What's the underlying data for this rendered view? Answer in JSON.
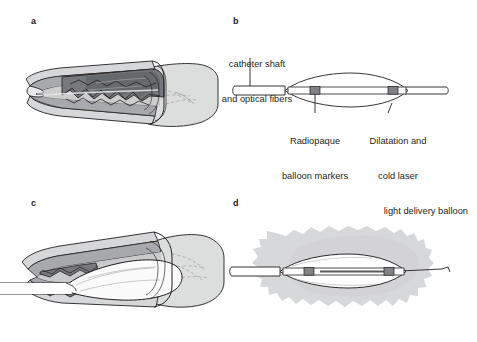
{
  "figure": {
    "background_color": "#ffffff",
    "ink_color": "#231f20"
  },
  "panels": [
    {
      "id": "a",
      "letter": "a",
      "name": "diseased-artery-cutaway",
      "description": "Cutaway longitudinal view of an artery with atherosclerotic plaque narrowing the lumen"
    },
    {
      "id": "b",
      "letter": "b",
      "name": "laser-balloon-catheter-labeled",
      "description": "Side view of the deflated laser balloon catheter with labels"
    },
    {
      "id": "c",
      "letter": "c",
      "name": "balloon-inflated-in-artery",
      "description": "Balloon inflated inside the diseased artery compressing the plaque"
    },
    {
      "id": "d",
      "letter": "d",
      "name": "laser-light-delivery",
      "description": "Inflated balloon emitting diffuse cold laser light into surrounding tissue"
    }
  ],
  "labels": {
    "catheter_shaft": {
      "lines": [
        "catheter shaft",
        "and optical fibers"
      ],
      "line1": "catheter shaft",
      "line2": "and optical fibers"
    },
    "radiopaque_markers": {
      "lines": [
        "Radiopaque",
        "balloon markers"
      ],
      "line1": "Radiopaque",
      "line2": "balloon markers"
    },
    "dilatation_balloon": {
      "lines": [
        "Dilatation and",
        "cold laser",
        "light delivery balloon"
      ],
      "line1": "Dilatation and",
      "line2": "cold laser",
      "line3": "light delivery balloon"
    }
  },
  "colors": {
    "outline": "#231f20",
    "adventitia_light": "#d9dadb",
    "media_mid": "#a7a9ac",
    "plaque_dark": "#808285",
    "plaque_darker": "#6d6e71",
    "lumen_light": "#e6e7e8",
    "balloon_white": "#ffffff",
    "marker_gray": "#808285",
    "laser_cloud": "#d7d8d9",
    "distal_vessel": "#dcdddd"
  }
}
